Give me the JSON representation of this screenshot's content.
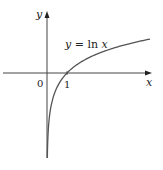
{
  "chart_data": {
    "type": "line",
    "title": "",
    "xlabel": "x",
    "ylabel": "y",
    "origin_label": "0",
    "x_tick_labels": [
      "1"
    ],
    "annotations": [
      "y = ln x"
    ],
    "series": [
      {
        "name": "y = ln x",
        "x": [
          0.01,
          0.05,
          0.1,
          0.2,
          0.3,
          0.5,
          0.75,
          1,
          1.5,
          2,
          2.5,
          3,
          3.5,
          4,
          4.5,
          5.15
        ],
        "values": [
          -4.2,
          -3.0,
          -2.3,
          -1.61,
          -1.2,
          -0.69,
          -0.29,
          0,
          0.41,
          0.69,
          0.92,
          1.1,
          1.25,
          1.39,
          1.5,
          1.64
        ]
      }
    ],
    "xlim": [
      -2.3,
      5.3
    ],
    "ylim": [
      -4.3,
      3.1
    ],
    "grid": false,
    "legend": "none",
    "colors": {
      "axis": "#333333",
      "curve": "#555555"
    }
  },
  "labels": {
    "y_axis": "y",
    "x_axis": "x",
    "origin": "0",
    "tick_one": "1",
    "curve": "y = ln x"
  }
}
